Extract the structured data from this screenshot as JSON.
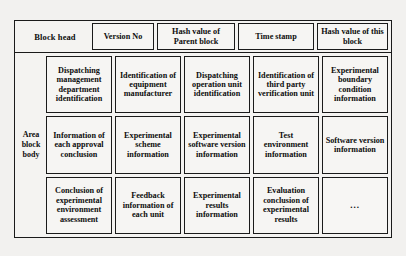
{
  "diagram": {
    "head": {
      "label": "Block head",
      "fields": [
        {
          "name": "version-no",
          "label": "Version No"
        },
        {
          "name": "parent-hash",
          "label": "Hash value of Parent block"
        },
        {
          "name": "time-stamp",
          "label": "Time stamp"
        },
        {
          "name": "this-hash",
          "label": "Hash value of this block"
        }
      ]
    },
    "body": {
      "label_lines": [
        "Area",
        "block",
        "body"
      ],
      "rows": [
        [
          {
            "name": "dispatching-management-department-identification",
            "label": "Dispatching management department identification"
          },
          {
            "name": "identification-of-equipment-manufacturer",
            "label": "Identification of equipment manufacturer"
          },
          {
            "name": "dispatching-operation-unit-identification",
            "label": "Dispatching operation unit identification"
          },
          {
            "name": "identification-of-third-party-verification-unit",
            "label": "Identification of third party verification unit"
          },
          {
            "name": "experimental-boundary-condition-information",
            "label": "Experimental boundary condition information"
          }
        ],
        [
          {
            "name": "information-of-each-approval-conclusion",
            "label": "Information of each approval conclusion"
          },
          {
            "name": "experimental-scheme-information",
            "label": "Experimental scheme information"
          },
          {
            "name": "experimental-software-version-information",
            "label": "Experimental software version information"
          },
          {
            "name": "test-environment-information",
            "label": "Test environment information"
          },
          {
            "name": "software-version-information",
            "label": "Software version information"
          }
        ],
        [
          {
            "name": "conclusion-of-experimental-environment-assessment",
            "label": "Conclusion of experimental environment assessment"
          },
          {
            "name": "feedback-information-of-each-unit",
            "label": "Feedback information of each unit"
          },
          {
            "name": "experimental-results-information",
            "label": "Experimental results information"
          },
          {
            "name": "evaluation-conclusion-of-experimental-results",
            "label": "Evaluation conclusion of experimental results"
          },
          {
            "name": "more-ellipsis",
            "label": "..."
          }
        ]
      ]
    }
  },
  "colors": {
    "page_background": "#f2f1ef",
    "frame_background": "#f4f3f1",
    "cell_background": "#f6f5f3",
    "border": "#1a1a1a",
    "text": "#0d0d0d"
  }
}
